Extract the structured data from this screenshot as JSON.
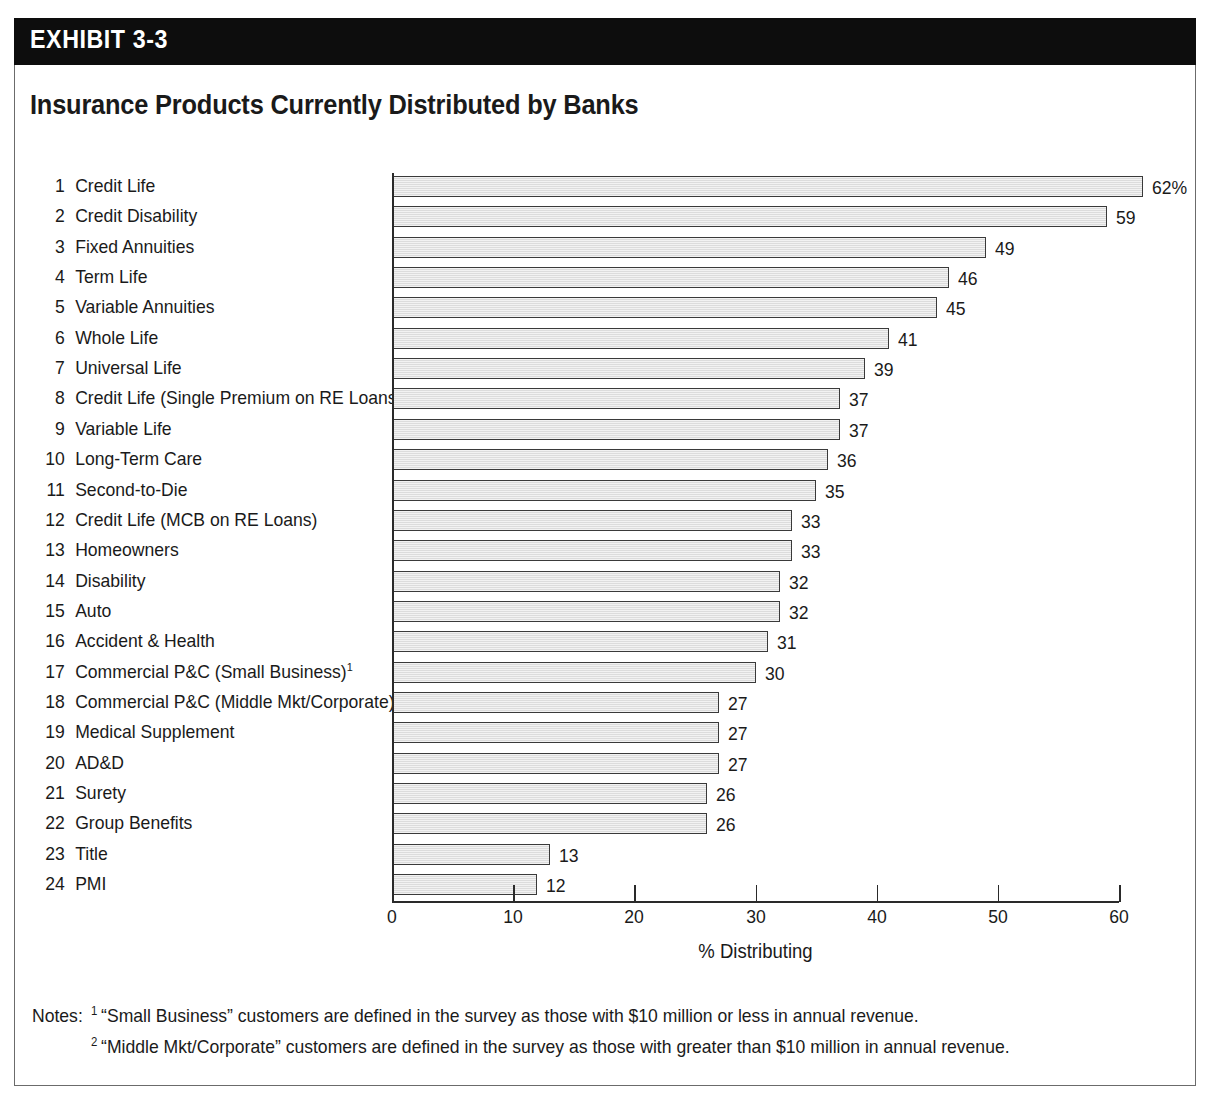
{
  "exhibit": {
    "band_label": "EXHIBIT 3-3",
    "title": "Insurance Products Currently Distributed by Banks"
  },
  "chart_data": {
    "type": "bar",
    "orientation": "horizontal",
    "title": "Insurance Products Currently Distributed by Banks",
    "xlabel": "% Distributing",
    "ylabel": "",
    "xlim": [
      0,
      60
    ],
    "xticks": [
      0,
      10,
      20,
      30,
      40,
      50,
      60
    ],
    "grid": false,
    "legend": "none",
    "value_suffix_first": "%",
    "categories": [
      "Credit Life",
      "Credit Disability",
      "Fixed Annuities",
      "Term Life",
      "Variable Annuities",
      "Whole Life",
      "Universal Life",
      "Credit Life (Single Premium on RE Loans)",
      "Variable Life",
      "Long-Term Care",
      "Second-to-Die",
      "Credit Life (MCB on RE Loans)",
      "Homeowners",
      "Disability",
      "Auto",
      "Accident & Health",
      "Commercial P&C (Small Business)",
      "Commercial P&C (Middle Mkt/Corporate)",
      "Medical Supplement",
      "AD&D",
      "Surety",
      "Group Benefits",
      "Title",
      "PMI"
    ],
    "ranks": [
      1,
      2,
      3,
      4,
      5,
      6,
      7,
      8,
      9,
      10,
      11,
      12,
      13,
      14,
      15,
      16,
      17,
      18,
      19,
      20,
      21,
      22,
      23,
      24
    ],
    "footnote_markers": [
      "",
      "",
      "",
      "",
      "",
      "",
      "",
      "",
      "",
      "",
      "",
      "",
      "",
      "",
      "",
      "",
      "1",
      "2",
      "",
      "",
      "",
      "",
      "",
      ""
    ],
    "values": [
      62,
      59,
      49,
      46,
      45,
      41,
      39,
      37,
      37,
      36,
      35,
      33,
      33,
      32,
      32,
      31,
      30,
      27,
      27,
      27,
      26,
      26,
      13,
      12
    ],
    "value_labels": [
      "62%",
      "59",
      "49",
      "46",
      "45",
      "41",
      "39",
      "37",
      "37",
      "36",
      "35",
      "33",
      "33",
      "32",
      "32",
      "31",
      "30",
      "27",
      "27",
      "27",
      "26",
      "26",
      "13",
      "12"
    ]
  },
  "notes": {
    "label": "Notes:",
    "items": [
      {
        "marker": "1",
        "text": "“Small Business” customers are defined in the survey as those with $10 million or less in annual revenue."
      },
      {
        "marker": "2",
        "text": "“Middle Mkt/Corporate” customers are defined in the survey as those with greater than $10 million in annual revenue."
      }
    ]
  },
  "colors": {
    "band_background": "#0d0d0d",
    "band_text": "#ffffff",
    "bar_fill": "#e3e3e3",
    "bar_stroke": "#3a3a3a",
    "axis": "#2a2a2a",
    "text": "#1a1a1a",
    "frame": "#6b6b6b"
  }
}
